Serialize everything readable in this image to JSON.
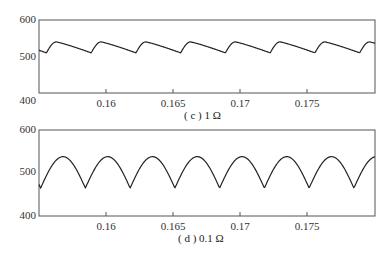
{
  "chart_data": [
    {
      "type": "line",
      "title": "",
      "caption": "(c) 1 Ω",
      "xlabel": "",
      "ylabel": "",
      "xlim": [
        0.155,
        0.18
      ],
      "ylim": [
        400,
        600
      ],
      "xticks": [
        0.16,
        0.165,
        0.17,
        0.175
      ],
      "xtick_labels": [
        "0.16",
        "0.165",
        "0.17",
        "0.175"
      ],
      "yticks": [
        400,
        500,
        600
      ],
      "ytick_labels": [
        "400",
        "500",
        "600"
      ],
      "grid": false,
      "series": [
        {
          "name": "1 Ω",
          "shape": "sawtooth-like ripple: sharp rise then slow decay",
          "period": 0.00333,
          "x": [
            0.155,
            0.1556,
            0.1563,
            0.1589,
            0.1596,
            0.1623,
            0.1629,
            0.1656,
            0.1662,
            0.1689,
            0.1696,
            0.1723,
            0.1729,
            0.1756,
            0.1762,
            0.1789,
            0.1796
          ],
          "y": [
            515,
            510,
            540,
            510,
            540,
            512,
            540,
            512,
            540,
            512,
            540,
            512,
            540,
            512,
            540,
            512,
            545
          ]
        }
      ]
    },
    {
      "type": "line",
      "title": "",
      "caption": "(d) 0.1 Ω",
      "xlabel": "",
      "ylabel": "",
      "xlim": [
        0.155,
        0.18
      ],
      "ylim": [
        400,
        600
      ],
      "xticks": [
        0.16,
        0.165,
        0.17,
        0.175
      ],
      "xtick_labels": [
        "0.16",
        "0.165",
        "0.17",
        "0.175"
      ],
      "yticks": [
        400,
        500,
        600
      ],
      "ytick_labels": [
        "400",
        "500",
        "600"
      ],
      "grid": false,
      "series": [
        {
          "name": "0.1 Ω",
          "shape": "rectified-sine arches with cusps",
          "period": 0.00333,
          "x": [
            0.155,
            0.1567,
            0.1584,
            0.16,
            0.1617,
            0.1634,
            0.165,
            0.1667,
            0.1684,
            0.17,
            0.1717,
            0.1734,
            0.175,
            0.1767,
            0.1784,
            0.18
          ],
          "y": [
            460,
            538,
            465,
            538,
            465,
            538,
            465,
            538,
            465,
            538,
            465,
            538,
            465,
            538,
            465,
            540
          ]
        }
      ]
    }
  ],
  "charts": [
    {
      "caption": "( c ) 1 Ω",
      "yticks": [
        "600",
        "500",
        "400"
      ],
      "xticks": [
        "0.16",
        "0.165",
        "0.17",
        "0.175"
      ]
    },
    {
      "caption": "( d ) 0.1 Ω",
      "yticks": [
        "600",
        "500",
        "400"
      ],
      "xticks": [
        "0.16",
        "0.165",
        "0.17",
        "0.175"
      ]
    }
  ]
}
